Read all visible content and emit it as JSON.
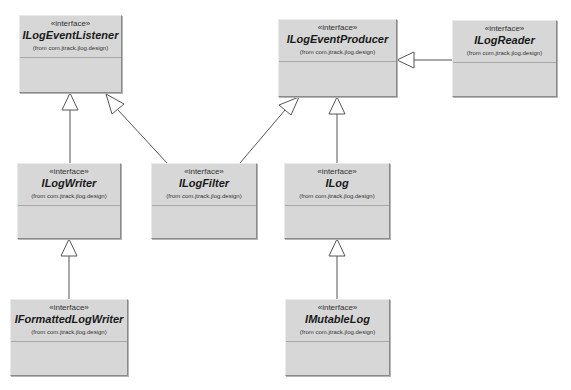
{
  "diagram": {
    "type": "UML class diagram",
    "classes": [
      {
        "id": "ILogEventListener",
        "stereotype": "«interface»",
        "name": "ILogEventListener",
        "from": "(from com.jtrack.jlog.design)"
      },
      {
        "id": "ILogEventProducer",
        "stereotype": "«interface»",
        "name": "ILogEventProducer",
        "from": "(from com.jtrack.jlog.design)"
      },
      {
        "id": "ILogReader",
        "stereotype": "«interface»",
        "name": "ILogReader",
        "from": "(from com.jtrack.jlog.design)"
      },
      {
        "id": "ILogWriter",
        "stereotype": "«interface»",
        "name": "ILogWriter",
        "from": "(from com.jtrack.jlog.design)"
      },
      {
        "id": "ILogFilter",
        "stereotype": "«interface»",
        "name": "ILogFilter",
        "from": "(from com.jtrack.jlog.design)"
      },
      {
        "id": "ILog",
        "stereotype": "«interface»",
        "name": "ILog",
        "from": "(from com.jtrack.jlog.design)"
      },
      {
        "id": "IFormattedLogWriter",
        "stereotype": "«interface»",
        "name": "IFormattedLogWriter",
        "from": "(from com.jtrack.jlog.design)"
      },
      {
        "id": "IMutableLog",
        "stereotype": "«interface»",
        "name": "IMutableLog",
        "from": "(from com.jtrack.jlog.design)"
      }
    ],
    "relations": [
      {
        "type": "generalization",
        "from": "ILogWriter",
        "to": "ILogEventListener"
      },
      {
        "type": "generalization",
        "from": "ILogFilter",
        "to": "ILogEventListener"
      },
      {
        "type": "generalization",
        "from": "ILogFilter",
        "to": "ILogEventProducer"
      },
      {
        "type": "generalization",
        "from": "ILog",
        "to": "ILogEventProducer"
      },
      {
        "type": "generalization",
        "from": "ILogReader",
        "to": "ILogEventProducer"
      },
      {
        "type": "generalization",
        "from": "IFormattedLogWriter",
        "to": "ILogWriter"
      },
      {
        "type": "generalization",
        "from": "IMutableLog",
        "to": "ILog"
      }
    ]
  }
}
